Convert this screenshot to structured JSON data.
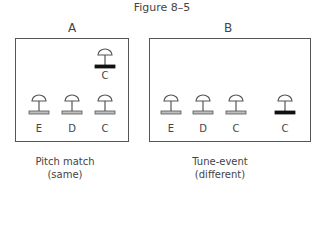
{
  "figure": {
    "title": "Figure 8–5"
  },
  "panels": [
    {
      "id": "A",
      "label": "A",
      "caption_line1": "Pitch match",
      "caption_line2": "(same)",
      "bells": [
        {
          "note": "C",
          "base": "dark",
          "row": "top"
        },
        {
          "note": "E",
          "base": "light",
          "row": "bottom"
        },
        {
          "note": "D",
          "base": "light",
          "row": "bottom"
        },
        {
          "note": "C",
          "base": "light",
          "row": "bottom"
        }
      ]
    },
    {
      "id": "B",
      "label": "B",
      "caption_line1": "Tune-event",
      "caption_line2": "(different)",
      "bells": [
        {
          "note": "E",
          "base": "light",
          "row": "bottom"
        },
        {
          "note": "D",
          "base": "light",
          "row": "bottom"
        },
        {
          "note": "C",
          "base": "light",
          "row": "bottom"
        },
        {
          "note": "C",
          "base": "dark",
          "row": "bottom"
        }
      ]
    }
  ],
  "colors": {
    "line": "#555555",
    "base_light": "#bdbdbd",
    "base_dark": "#111111"
  }
}
